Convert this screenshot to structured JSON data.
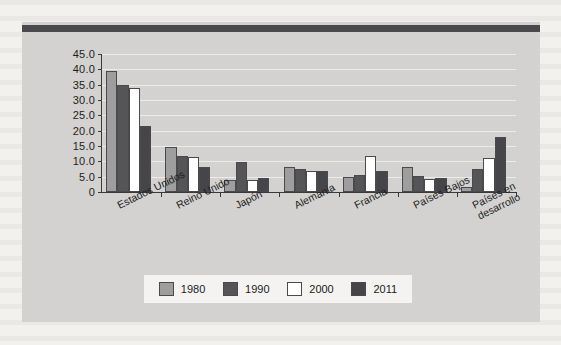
{
  "figure": {
    "background_color": "#d3d2d0",
    "top_rule_color": "#4a4a4c"
  },
  "legend": {
    "position": "bottom-center",
    "entries": [
      {
        "label": "1980",
        "color": "#9e9e9e",
        "swatch_name": "legend-swatch-1980"
      },
      {
        "label": "1990",
        "color": "#555557",
        "swatch_name": "legend-swatch-1990"
      },
      {
        "label": "2000",
        "color": "#ffffff",
        "swatch_name": "legend-swatch-2000"
      },
      {
        "label": "2011",
        "color": "#46464a",
        "swatch_name": "legend-swatch-2011"
      }
    ]
  },
  "chart_data": {
    "type": "bar",
    "title": "",
    "subtitle": "",
    "xlabel": "",
    "ylabel": "",
    "grid": true,
    "legend_position": "bottom",
    "ylim": [
      0,
      45
    ],
    "ytick_labels": [
      "45.0",
      "40.0",
      "35.0",
      "30.0",
      "25.0",
      "20.0",
      "15.0",
      "10.0",
      "5.0",
      "0"
    ],
    "ytick_values": [
      45,
      40,
      35,
      30,
      25,
      20,
      15,
      10,
      5,
      0
    ],
    "categories": [
      "Estados Unidos",
      "Reino Unido",
      "Japón",
      "Alemania",
      "Francia",
      "Países Bajos",
      "Países en\ndesarrollo"
    ],
    "series": [
      {
        "name": "1980",
        "color": "#9e9e9e",
        "values": [
          39.4,
          14.7,
          3.9,
          8.1,
          4.8,
          8.0,
          1.6
        ]
      },
      {
        "name": "1990",
        "color": "#555557",
        "values": [
          35.0,
          11.8,
          9.8,
          7.4,
          5.6,
          5.2,
          7.4
        ]
      },
      {
        "name": "2000",
        "color": "#ffffff",
        "values": [
          33.9,
          11.5,
          3.8,
          7.0,
          11.9,
          4.1,
          11.0
        ]
      },
      {
        "name": "2011",
        "color": "#46464a",
        "values": [
          21.5,
          8.3,
          4.6,
          6.9,
          6.8,
          4.6,
          18.0
        ]
      }
    ]
  }
}
